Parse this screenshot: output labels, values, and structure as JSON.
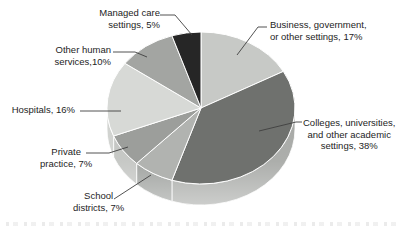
{
  "chart_data": {
    "type": "pie",
    "style": "3d",
    "unit": "percent",
    "order": "clockwise-from-top",
    "legend": "callout-labels",
    "total": 100,
    "slices": [
      {
        "name": "business-government-other-settings",
        "label": "Business, government,\nor other settings, 17%",
        "category": "Business, government, or other settings",
        "value": 17,
        "color": "#c7c9c6",
        "side_color": "#b4b6b3"
      },
      {
        "name": "colleges-universities-academic-settings",
        "label": "Colleges, universities,\nand other academic\nsettings, 38%",
        "category": "Colleges, universities, and other academic settings",
        "value": 38,
        "color": "#6f716e",
        "side_color": "#a7a9a6"
      },
      {
        "name": "school-districts",
        "label": "School\ndistricts, 7%",
        "category": "School districts",
        "value": 7,
        "color": "#b1b3b0",
        "side_color": "#9da09d"
      },
      {
        "name": "private-practice",
        "label": "Private\npractice, 7%",
        "category": "Private practice",
        "value": 7,
        "color": "#9c9e9b",
        "side_color": "#c3c5c2"
      },
      {
        "name": "hospitals",
        "label": "Hospitals, 16%",
        "category": "Hospitals",
        "value": 16,
        "color": "#d7d9d6",
        "side_color": "#d0d2cf"
      },
      {
        "name": "other-human-services",
        "label": "Other human\nservices,10%",
        "category": "Other human services",
        "value": 10,
        "color": "#a3a5a2",
        "side_color": "#b0b2af"
      },
      {
        "name": "managed-care-settings",
        "label": "Managed care\nsettings, 5%",
        "category": "Managed care settings",
        "value": 5,
        "color": "#262626",
        "side_color": "#6a6a6a"
      }
    ]
  }
}
